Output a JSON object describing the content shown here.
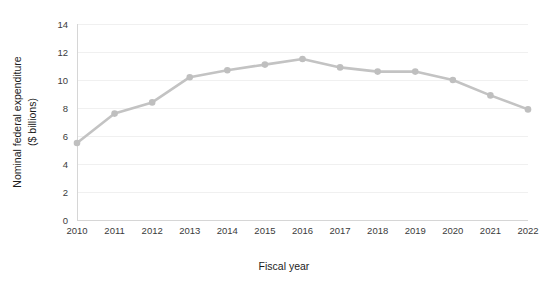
{
  "chart_data": {
    "type": "line",
    "title": "",
    "xlabel": "Fiscal year",
    "ylabel_line1": "Nominal federal expenditure",
    "ylabel_line2": "($ billions)",
    "categories": [
      "2010",
      "2011",
      "2012",
      "2013",
      "2014",
      "2015",
      "2016",
      "2017",
      "2018",
      "2019",
      "2020",
      "2021",
      "2022"
    ],
    "values": [
      5.5,
      7.6,
      8.4,
      10.2,
      10.7,
      11.1,
      11.5,
      10.9,
      10.6,
      10.6,
      10.0,
      8.9,
      7.9
    ],
    "ylim": [
      0,
      14
    ],
    "yticks": [
      0,
      2,
      4,
      6,
      8,
      10,
      12,
      14
    ],
    "ytick_labels": [
      "0",
      "2",
      "4",
      "6",
      "8",
      "10",
      "12",
      "14"
    ],
    "grid": true,
    "legend": false,
    "series_color": "#c3c3c3",
    "marker_color": "#bfbfbf",
    "gridline_color": "#f0f0f0",
    "axis_color": "#d6d6d6",
    "background_color": "#ffffff"
  }
}
